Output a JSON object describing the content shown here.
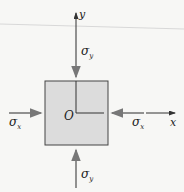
{
  "diagram": {
    "axes": {
      "x_label": "x",
      "y_label": "y",
      "origin_label": "O"
    },
    "stresses": {
      "sigma_x_left": "σx",
      "sigma_x_right": "σx",
      "sigma_y_top": "σy",
      "sigma_y_bottom": "σy",
      "sub_x": "x",
      "sub_y": "y"
    },
    "colors": {
      "element_fill": "#dcdcdc",
      "element_stroke": "#444444",
      "arrow": "#777777",
      "axis": "#333333"
    }
  }
}
